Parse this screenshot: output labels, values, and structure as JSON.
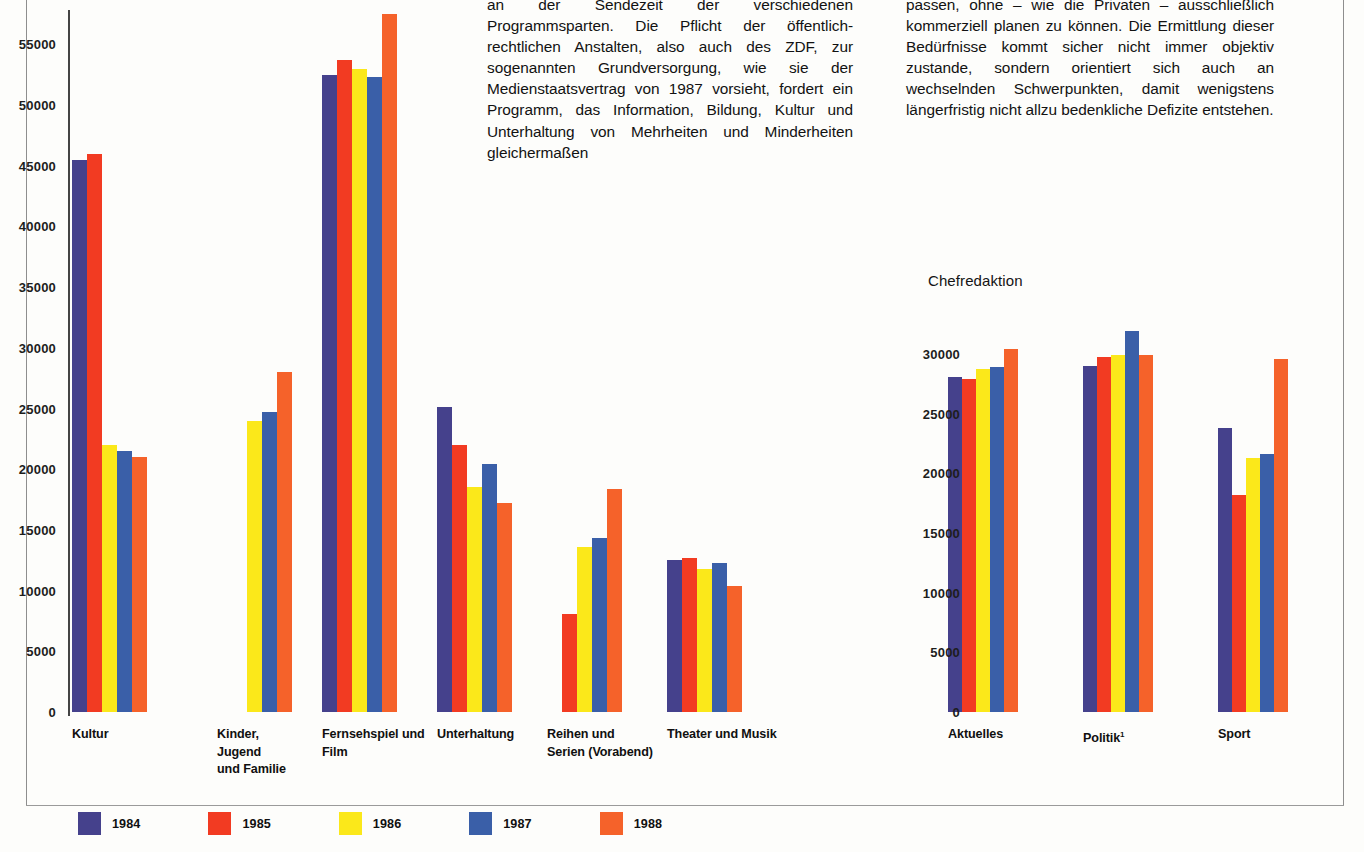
{
  "page": {
    "background_color": "#fdfdfb",
    "rule_color": "#8e8e8e"
  },
  "text_columns": {
    "middle": "an der Sendezeit der verschiedenen Programmsparten. Die Pflicht der öffentlich-rechtlichen Anstalten, also auch des ZDF, zur sogenannten Grundversorgung, wie sie der Medienstaatsvertrag von 1987 vorsieht, fordert ein Programm, das Information, Bildung, Kultur und Unterhaltung von Mehrheiten und Minderheiten gleichermaßen",
    "right": "passen, ohne – wie die Privaten – ausschließlich kommerziell planen zu können. Die Ermittlung dieser Bedürfnisse kommt sicher nicht immer objektiv zustande, sondern orientiert sich auch an wechselnden Schwerpunkten, damit wenigstens längerfristig nicht allzu bedenkliche Defizite entstehen."
  },
  "legend": {
    "items": [
      {
        "label": "1984",
        "color": "#45418c"
      },
      {
        "label": "1985",
        "color": "#f23b22"
      },
      {
        "label": "1986",
        "color": "#fbe81a"
      },
      {
        "label": "1987",
        "color": "#3a5fa8"
      },
      {
        "label": "1988",
        "color": "#f5622a"
      }
    ]
  },
  "chart_data": [
    {
      "id": "programmsparten",
      "type": "bar",
      "title": "",
      "xlabel": "",
      "ylabel": "",
      "ylim": [
        0,
        57500
      ],
      "yticks": [
        0,
        5000,
        10000,
        15000,
        20000,
        25000,
        30000,
        35000,
        40000,
        45000,
        50000,
        55000
      ],
      "ytick_labels": [
        "0",
        "5000",
        "10000",
        "15000",
        "20000",
        "25000",
        "30000",
        "35000",
        "40000",
        "45000",
        "50000",
        "55000"
      ],
      "grid": false,
      "legend_position": "bottom",
      "categories": [
        "Kultur",
        "Kinder,\nJugend\nund Familie",
        "Fernsehspiel und\nFilm",
        "Unterhaltung",
        "Reihen und\nSerien (Vorabend)",
        "Theater und Musik"
      ],
      "series": [
        {
          "name": "1984",
          "color": "#45418c",
          "values": [
            45500,
            null,
            52500,
            25100,
            null,
            12500
          ]
        },
        {
          "name": "1985",
          "color": "#f23b22",
          "values": [
            46000,
            null,
            53700,
            22000,
            8100,
            12700
          ]
        },
        {
          "name": "1986",
          "color": "#fbe81a",
          "values": [
            22000,
            24000,
            53000,
            18500,
            13600,
            11800
          ]
        },
        {
          "name": "1987",
          "color": "#3a5fa8",
          "values": [
            21500,
            24700,
            52300,
            20400,
            14300,
            12300
          ]
        },
        {
          "name": "1988",
          "color": "#f5622a",
          "values": [
            21000,
            28000,
            57500,
            17200,
            18400,
            10400
          ]
        }
      ],
      "notes": "Fernsehspiel und Film 1988 bar is clipped at the top of the plot area."
    },
    {
      "id": "chefredaktion",
      "type": "bar",
      "title": "Chefredaktion",
      "xlabel": "",
      "ylabel": "",
      "ylim": [
        0,
        33000
      ],
      "yticks": [
        0,
        5000,
        10000,
        15000,
        20000,
        25000,
        30000
      ],
      "ytick_labels": [
        "0",
        "5000",
        "10000",
        "15000",
        "20000",
        "25000",
        "30000"
      ],
      "grid": false,
      "legend_position": "bottom",
      "categories": [
        "Aktuelles",
        "Politik¹",
        "Sport"
      ],
      "series": [
        {
          "name": "1984",
          "color": "#45418c",
          "values": [
            28100,
            29000,
            23800
          ]
        },
        {
          "name": "1985",
          "color": "#f23b22",
          "values": [
            27900,
            29700,
            18200
          ]
        },
        {
          "name": "1986",
          "color": "#fbe81a",
          "values": [
            28700,
            29900,
            21300
          ]
        },
        {
          "name": "1987",
          "color": "#3a5fa8",
          "values": [
            28900,
            31900,
            21600
          ]
        },
        {
          "name": "1988",
          "color": "#f5622a",
          "values": [
            30400,
            29900,
            29600
          ]
        }
      ]
    }
  ]
}
